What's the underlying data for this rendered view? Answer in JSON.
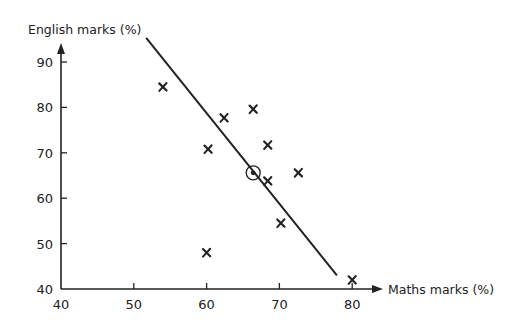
{
  "chart_data": {
    "type": "scatter",
    "title": "",
    "xlabel": "Maths marks (%)",
    "ylabel": "English marks (%)",
    "xlim": [
      40,
      80
    ],
    "ylim": [
      40,
      90
    ],
    "x_ticks": [
      40,
      50,
      60,
      70,
      80
    ],
    "y_ticks": [
      40,
      50,
      60,
      70,
      80,
      90
    ],
    "grid": false,
    "legend": null,
    "series": [
      {
        "name": "students",
        "marker": "x",
        "points": [
          {
            "x": 54,
            "y": 84.5
          },
          {
            "x": 62.4,
            "y": 77.7
          },
          {
            "x": 66.4,
            "y": 79.6
          },
          {
            "x": 60.2,
            "y": 70.8
          },
          {
            "x": 68.4,
            "y": 71.7
          },
          {
            "x": 68.4,
            "y": 63.8
          },
          {
            "x": 72.6,
            "y": 65.6
          },
          {
            "x": 70.2,
            "y": 54.5
          },
          {
            "x": 60,
            "y": 48
          },
          {
            "x": 80,
            "y": 42
          }
        ]
      }
    ],
    "mean_point": {
      "x": 66.4,
      "y": 65.6,
      "marker": "circled-dot"
    },
    "line_of_best_fit": {
      "start": {
        "x": 51.7,
        "y": 95.3
      },
      "end": {
        "x": 77.9,
        "y": 43
      }
    }
  },
  "colors": {
    "ink": "#222222",
    "background": "#ffffff"
  }
}
